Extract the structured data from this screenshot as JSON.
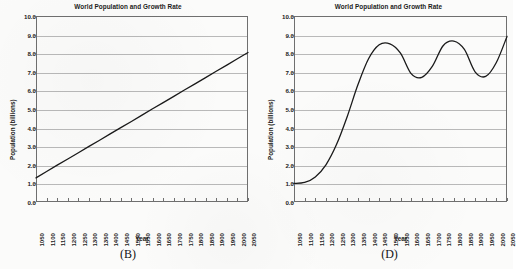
{
  "figure": {
    "background_color": "#fbfbfa",
    "line_color": "#1a1a1a",
    "grid_color": "#b9b9b9",
    "axis_color": "#6f6f6f"
  },
  "panels": [
    {
      "caption": "(B)",
      "chart_data": {
        "type": "line",
        "title": "World Population and Growth Rate",
        "xlabel": "Year",
        "ylabel": "Population (billions)",
        "ylim": [
          0.0,
          10.0
        ],
        "ytick_labels": [
          "0.0",
          "1.0",
          "2.0",
          "3.0",
          "4.0",
          "5.0",
          "6.0",
          "7.0",
          "8.0",
          "9.0",
          "10.0"
        ],
        "ytick_values": [
          0.0,
          1.0,
          2.0,
          3.0,
          4.0,
          5.0,
          6.0,
          7.0,
          8.0,
          9.0,
          10.0
        ],
        "grid": true,
        "legend": "none",
        "categories": [
          "1050",
          "1100",
          "1150",
          "1200",
          "1250",
          "1300",
          "1350",
          "1400",
          "1450",
          "1500",
          "1550",
          "1600",
          "1650",
          "1700",
          "1750",
          "1800",
          "1850",
          "1900",
          "1950",
          "2000",
          "2050"
        ],
        "x": [
          1050,
          1100,
          1150,
          1200,
          1250,
          1300,
          1350,
          1400,
          1450,
          1500,
          1550,
          1600,
          1650,
          1700,
          1750,
          1800,
          1850,
          1900,
          1950,
          2000,
          2050
        ],
        "values": [
          1.3,
          1.64,
          1.98,
          2.31,
          2.65,
          2.99,
          3.32,
          3.66,
          4.0,
          4.33,
          4.67,
          5.01,
          5.34,
          5.68,
          6.02,
          6.35,
          6.69,
          7.03,
          7.36,
          7.7,
          8.04
        ]
      }
    },
    {
      "caption": "(D)",
      "chart_data": {
        "type": "line",
        "title": "World Population and Growth Rate",
        "xlabel": "Year",
        "ylabel": "Population (billions)",
        "ylim": [
          0.0,
          10.0
        ],
        "ytick_labels": [
          "0.0",
          "1.0",
          "2.0",
          "3.0",
          "4.0",
          "5.0",
          "6.0",
          "7.0",
          "8.0",
          "9.0",
          "10.0"
        ],
        "ytick_values": [
          0.0,
          1.0,
          2.0,
          3.0,
          4.0,
          5.0,
          6.0,
          7.0,
          8.0,
          9.0,
          10.0
        ],
        "grid": true,
        "legend": "none",
        "categories": [
          "1050",
          "1100",
          "1150",
          "1200",
          "1250",
          "1300",
          "1350",
          "1400",
          "1450",
          "1500",
          "1550",
          "1600",
          "1650",
          "1700",
          "1750",
          "1800",
          "1850",
          "1900",
          "1950",
          "2000",
          "2050"
        ],
        "x": [
          1050,
          1100,
          1150,
          1200,
          1250,
          1300,
          1350,
          1400,
          1450,
          1500,
          1550,
          1600,
          1650,
          1700,
          1750,
          1800,
          1850,
          1900,
          1950,
          2000,
          2050
        ],
        "values": [
          1.0,
          1.05,
          1.35,
          2.0,
          3.1,
          4.6,
          6.3,
          7.7,
          8.45,
          8.5,
          8.0,
          6.9,
          6.7,
          7.3,
          8.4,
          8.65,
          8.2,
          7.0,
          6.75,
          7.5,
          8.9
        ]
      }
    }
  ]
}
